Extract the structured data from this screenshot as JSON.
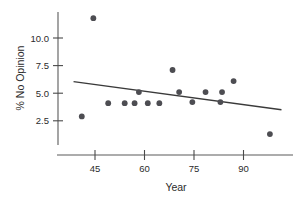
{
  "chart_data": {
    "type": "scatter",
    "title": "",
    "xlabel": "Year",
    "ylabel": "% No Opinion",
    "xlim": [
      37,
      103
    ],
    "ylim": [
      0.3,
      12.6
    ],
    "xticks": [
      45,
      60,
      75,
      90
    ],
    "xtick_labels": [
      "45",
      "60",
      "75",
      "90"
    ],
    "yticks": [
      2.5,
      5.0,
      7.5,
      10.0
    ],
    "ytick_labels": [
      "2.5",
      "5.0",
      "7.5",
      "10.0"
    ],
    "grid": false,
    "legend": "none",
    "marker": "filled-circle",
    "marker_color": "#4d4d52",
    "line_color": "#3a3a3a",
    "axis_color": "#5a5a5a",
    "points": [
      {
        "x": 41.0,
        "y": 2.9
      },
      {
        "x": 44.5,
        "y": 11.8
      },
      {
        "x": 49.0,
        "y": 4.1
      },
      {
        "x": 54.0,
        "y": 4.1
      },
      {
        "x": 57.0,
        "y": 4.1
      },
      {
        "x": 58.3,
        "y": 5.1
      },
      {
        "x": 61.0,
        "y": 4.1
      },
      {
        "x": 64.5,
        "y": 4.1
      },
      {
        "x": 68.5,
        "y": 7.1
      },
      {
        "x": 70.5,
        "y": 5.1
      },
      {
        "x": 74.5,
        "y": 4.2
      },
      {
        "x": 78.5,
        "y": 5.1
      },
      {
        "x": 83.0,
        "y": 4.2
      },
      {
        "x": 83.5,
        "y": 5.1
      },
      {
        "x": 87.0,
        "y": 6.1
      },
      {
        "x": 98.0,
        "y": 1.3
      }
    ],
    "trend_line": {
      "x_start": 38.5,
      "y_start": 6.05,
      "x_end": 101.5,
      "y_end": 3.5
    }
  }
}
